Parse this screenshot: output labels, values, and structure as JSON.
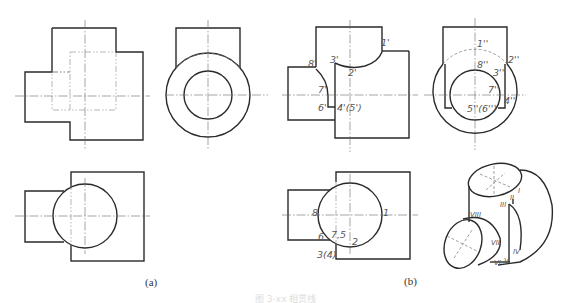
{
  "figure": {
    "captions": {
      "a": "(a)",
      "b": "(b)"
    },
    "bottom_caption": "图 3-xx 相贯线",
    "views_b": {
      "front_labels": [
        "1'",
        "2'",
        "3'",
        "8'",
        "7'",
        "6'",
        "4'(5')"
      ],
      "side_labels": [
        "1''",
        "2''",
        "3''",
        "8''",
        "7''",
        "4''",
        "5''(6'')"
      ],
      "top_labels": [
        "8",
        "1",
        "6",
        "7,5",
        "2",
        "3(4)"
      ],
      "iso_labels": [
        "I",
        "II",
        "III",
        "IV",
        "V",
        "VI",
        "VII",
        "VIII"
      ]
    }
  }
}
